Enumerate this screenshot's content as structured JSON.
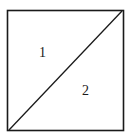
{
  "diagram": {
    "shape": "square divided by diagonal",
    "regions": [
      {
        "id": "region-1",
        "label": "1",
        "position": "upper-left triangle"
      },
      {
        "id": "region-2",
        "label": "2",
        "position": "lower-right triangle"
      }
    ],
    "colors": {
      "stroke": "#1a1a1a",
      "background": "#ffffff"
    }
  }
}
